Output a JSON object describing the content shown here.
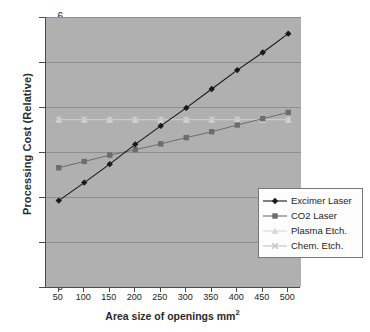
{
  "chart_data": {
    "type": "line",
    "title": "",
    "xlabel": "Area size of openings mm2",
    "xlabel_base": "Area size of openings mm",
    "xlabel_sup": "2",
    "ylabel": "Processing Cost (Relative)",
    "x": [
      50,
      100,
      150,
      200,
      250,
      300,
      350,
      400,
      450,
      500
    ],
    "x_tick_labels": [
      "50",
      "100",
      "150",
      "200",
      "250",
      "300",
      "350",
      "400",
      "450",
      "500"
    ],
    "y_tick_labels": [
      "0",
      "1",
      "2",
      "3",
      "4",
      "5",
      "6"
    ],
    "ylim": [
      0,
      6
    ],
    "xlim_categories": true,
    "grid": "horizontal",
    "legend_position": "bottom-right",
    "plot_background": "#b0b0b0",
    "series": [
      {
        "name": "Excimer Laser",
        "marker": "diamond",
        "color": "#1a1a1a",
        "values": [
          1.92,
          2.32,
          2.73,
          3.17,
          3.58,
          3.98,
          4.4,
          4.82,
          5.21,
          5.63
        ]
      },
      {
        "name": "CO2 Laser",
        "marker": "square",
        "color": "#6d6d6d",
        "values": [
          2.65,
          2.79,
          2.93,
          3.05,
          3.18,
          3.32,
          3.45,
          3.6,
          3.74,
          3.88
        ]
      },
      {
        "name": "Plasma Etch.",
        "marker": "triangle",
        "color": "#e2e2e2",
        "values": [
          3.72,
          3.72,
          3.72,
          3.72,
          3.72,
          3.72,
          3.72,
          3.72,
          3.72,
          3.72
        ]
      },
      {
        "name": "Chem. Etch.",
        "marker": "cross",
        "color": "#c9c9c9",
        "values": [
          3.72,
          3.72,
          3.72,
          3.72,
          3.72,
          3.72,
          3.72,
          3.72,
          3.72,
          3.72
        ]
      }
    ]
  },
  "legend": {
    "items": [
      {
        "label": "Excimer Laser",
        "marker": "diamond",
        "color": "#1a1a1a"
      },
      {
        "label": "CO2 Laser",
        "marker": "square",
        "color": "#6d6d6d"
      },
      {
        "label": "Plasma Etch.",
        "marker": "triangle",
        "color": "#d9d9d9"
      },
      {
        "label": "Chem. Etch.",
        "marker": "cross",
        "color": "#c4c4c4"
      }
    ]
  }
}
